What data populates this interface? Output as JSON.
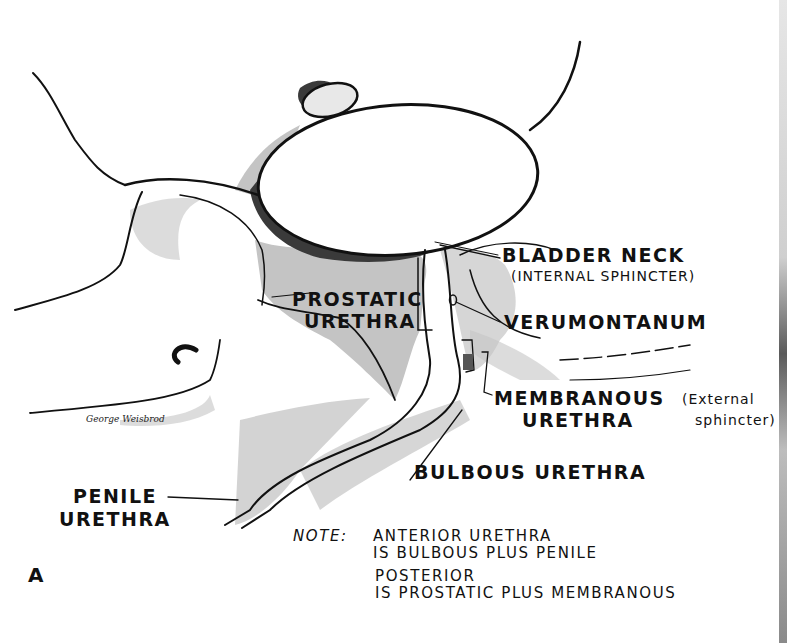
{
  "figure": {
    "panel_label": "A",
    "signature": "George Weisbrod",
    "labels": {
      "bladder_neck": "BLADDER NECK",
      "internal_sphincter": "(INTERNAL SPHINCTER)",
      "prostatic_1": "PROSTATIC",
      "prostatic_2": "URETHRA",
      "verumontanum": "VERUMONTANUM",
      "membranous_1": "MEMBRANOUS",
      "membranous_2": "URETHRA",
      "external_1": "(External",
      "external_2": "sphincter)",
      "bulbous": "BULBOUS URETHRA",
      "penile_1": "PENILE",
      "penile_2": "URETHRA"
    },
    "note": {
      "heading": "NOTE:",
      "line1": "ANTERIOR URETHRA",
      "line2": "IS BULBOUS PLUS PENILE",
      "line3": "POSTERIOR",
      "line4": "IS PROSTATIC PLUS MEMBRANOUS"
    },
    "colors": {
      "ink": "#111111",
      "shade": "#bdbdbd",
      "dark_shade": "#555555",
      "paper": "#ffffff"
    }
  }
}
